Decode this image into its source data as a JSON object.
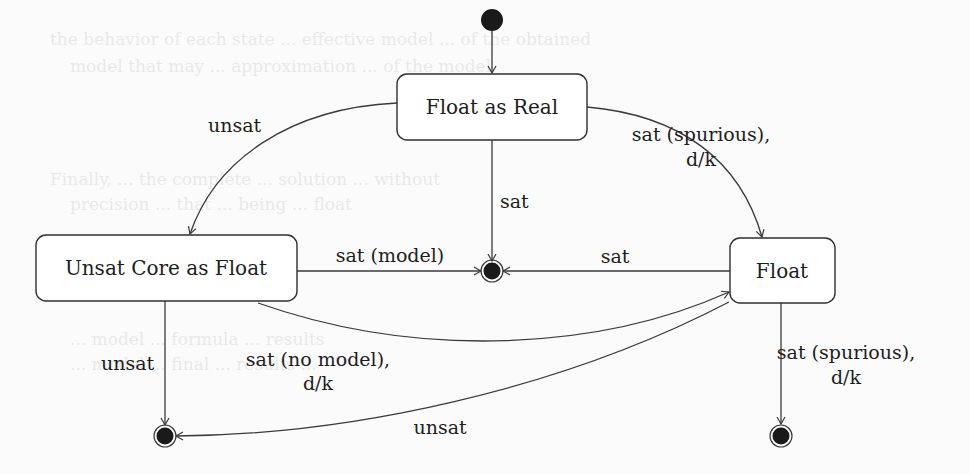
{
  "diagram": {
    "type": "state-machine",
    "initial": {
      "label": ""
    },
    "states": {
      "float_as_real": {
        "label": "Float as Real"
      },
      "unsat_core": {
        "label": "Unsat Core as Float"
      },
      "float": {
        "label": "Float"
      }
    },
    "transitions": {
      "real_to_core": {
        "label": "unsat"
      },
      "real_to_final_sat": {
        "label": "sat"
      },
      "real_to_float": {
        "line1": "sat (spurious),",
        "line2": "d/k"
      },
      "core_to_final_model": {
        "label": "sat (model)"
      },
      "float_to_final_sat": {
        "label": "sat"
      },
      "core_to_final_unsat": {
        "label": "unsat"
      },
      "core_to_float": {
        "line1": "sat (no model),",
        "line2": "d/k"
      },
      "float_to_final_unsat": {
        "label": "unsat"
      },
      "float_to_final_spurious": {
        "line1": "sat (spurious),",
        "line2": "d/k"
      }
    }
  },
  "colors": {
    "line": "#3a3a3a",
    "node_fill": "#1a1a1a",
    "background": "#fbfbfb"
  }
}
